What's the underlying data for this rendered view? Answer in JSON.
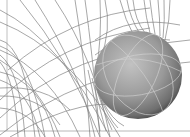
{
  "scene": {
    "description": "3D rendering: dense gray wireframe field-line curves with a shaded gray sphere carrying light great-circle lines",
    "background": "#ffffff",
    "wire_color": "#6a6a6a",
    "sphere": {
      "cx": 138,
      "cy": 75,
      "r": 44,
      "light_color": "#c4c4c4",
      "mid_color": "#8e8e8e",
      "dark_color": "#3c3c3c",
      "gridline_color": "#d6d6d6"
    },
    "frame": {
      "left_line_x": 7,
      "bottom_line_y": 131,
      "color": "#b0b0b0"
    }
  }
}
